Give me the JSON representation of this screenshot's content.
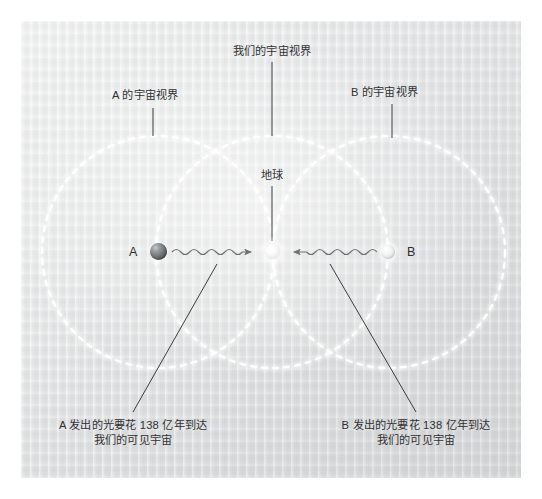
{
  "figure": {
    "background_color": "#e6e7e8",
    "panel_border_color": "#ffffff",
    "horizon_circle_color": "#ffffff",
    "leader_line_color": "#3a3c3e",
    "text_color": "#2f3133"
  },
  "labels": {
    "horizon_a": "A 的宇宙视界",
    "horizon_us": "我们的宇宙视界",
    "horizon_b": "B 的宇宙视界",
    "earth": "地球",
    "point_a": "A",
    "point_b": "B",
    "caption_a_line1": "A 发出的光要花 138 亿年到达",
    "caption_a_line2": "我们的可见宇宙",
    "caption_b_line1": "B 发出的光要花 138 亿年到达",
    "caption_b_line2": "我们的可见宇宙"
  },
  "diagram_data": {
    "type": "diagram",
    "subject": "cosmic horizons of observers A, Earth and B",
    "light_travel_time": "138 亿年",
    "circles": [
      {
        "name": "A 的宇宙视界",
        "cx": 158,
        "cy": 252,
        "r": 116,
        "style": "dashed"
      },
      {
        "name": "我们的宇宙视界",
        "cx": 272,
        "cy": 252,
        "r": 116,
        "style": "dashed"
      },
      {
        "name": "B 的宇宙视界",
        "cx": 389,
        "cy": 252,
        "r": 116,
        "style": "dashed"
      }
    ],
    "points": [
      {
        "name": "A",
        "x": 158,
        "y": 252,
        "shade": "dark"
      },
      {
        "name": "地球",
        "x": 272,
        "y": 252,
        "shade": "glowing-white"
      },
      {
        "name": "B",
        "x": 388,
        "y": 252,
        "shade": "light"
      }
    ],
    "light_rays": [
      {
        "from": "A",
        "to": "地球",
        "direction": "right",
        "style": "wavy-arrow"
      },
      {
        "from": "B",
        "to": "地球",
        "direction": "left",
        "style": "wavy-arrow"
      }
    ]
  }
}
